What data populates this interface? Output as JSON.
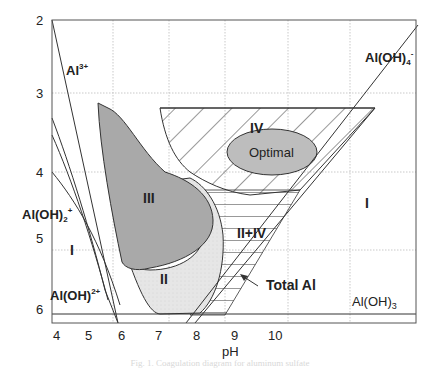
{
  "figure": {
    "caption": "Fig. 1. Coagulation diagram for aluminum sulfate",
    "xlabel": "pH",
    "x_ticks": [
      "4",
      "5",
      "6",
      "7",
      "8",
      "9",
      "10"
    ],
    "y_ticks": [
      "2",
      "3",
      "4",
      "5",
      "6"
    ],
    "regions": {
      "I_left": "I",
      "I_right": "I",
      "II": "II",
      "III": "III",
      "IV": "IV",
      "II_IV": "II+IV",
      "optimal": "Optimal"
    },
    "species": {
      "al3": "Al",
      "al3_sup": "3+",
      "aloh4": "Al(OH)",
      "aloh4_sub": "4",
      "aloh4_sup": "-",
      "aloh2": "Al(OH)",
      "aloh2_sub": "2",
      "aloh2_sup": "+",
      "aloh": "Al(OH)",
      "aloh_sup": "2+",
      "aloh3": "Al(OH)",
      "aloh3_sub": "3"
    },
    "annotation": "Total Al",
    "colors": {
      "region_III": "#a9a9a9",
      "region_II": "#e4e4e4",
      "optimal": "#bdbdbd",
      "lines": "#333333",
      "grid": "#bbbbbb"
    }
  }
}
